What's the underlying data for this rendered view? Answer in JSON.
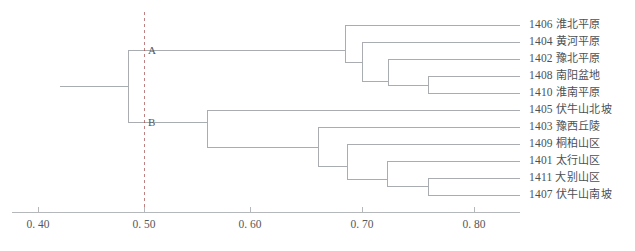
{
  "chart_data": {
    "type": "line",
    "title": "",
    "subtitle": "",
    "xlabel": "",
    "ylabel": "",
    "chart_kind": "dendrogram",
    "grid": false,
    "legend_position": "none",
    "axis": {
      "orientation": "horizontal",
      "ticks": [
        {
          "value": 0.4,
          "label": "0. 40",
          "x_px": 38
        },
        {
          "value": 0.5,
          "label": "0. 50",
          "x_px": 144
        },
        {
          "value": 0.6,
          "label": "0. 60",
          "x_px": 250
        },
        {
          "value": 0.7,
          "label": "0. 70",
          "x_px": 362
        },
        {
          "value": 0.8,
          "label": "0. 80",
          "x_px": 474
        }
      ],
      "xlim": [
        0.375,
        0.835
      ],
      "line_start_px": 12,
      "line_end_px": 520,
      "y_px": 212
    },
    "cut_line": {
      "value": 0.5,
      "x_px": 144,
      "style": "dashed",
      "label": ""
    },
    "cluster_tags": [
      {
        "label": "A",
        "x_px": 148,
        "y_px": 50
      },
      {
        "label": "B",
        "x_px": 148,
        "y_px": 122
      }
    ],
    "leaves": [
      {
        "code": "1406",
        "name": "淮北平原",
        "row": 1,
        "y_px": 25,
        "merge_x_px": 345
      },
      {
        "code": "1404",
        "name": "黄河平原",
        "row": 2,
        "y_px": 42,
        "merge_x_px": 362
      },
      {
        "code": "1402",
        "name": "豫北平原",
        "row": 3,
        "y_px": 59,
        "merge_x_px": 388
      },
      {
        "code": "1408",
        "name": "南阳盆地",
        "row": 4,
        "y_px": 76,
        "merge_x_px": 428
      },
      {
        "code": "1410",
        "name": "淮南平原",
        "row": 5,
        "y_px": 93,
        "merge_x_px": 428
      },
      {
        "code": "1405",
        "name": "伏牛山北坡",
        "row": 6,
        "y_px": 110,
        "merge_x_px": 207
      },
      {
        "code": "1403",
        "name": "豫西丘陵",
        "row": 7,
        "y_px": 127,
        "merge_x_px": 318
      },
      {
        "code": "1409",
        "name": "桐柏山区",
        "row": 8,
        "y_px": 144,
        "merge_x_px": 347
      },
      {
        "code": "1401",
        "name": "太行山区",
        "row": 9,
        "y_px": 161,
        "merge_x_px": 387
      },
      {
        "code": "1411",
        "name": "大别山区",
        "row": 10,
        "y_px": 178,
        "merge_x_px": 428
      },
      {
        "code": "1407",
        "name": "伏牛山南坡",
        "row": 11,
        "y_px": 195,
        "merge_x_px": 428
      }
    ],
    "nodes": [
      {
        "id": "root",
        "x_px": 128,
        "value": 0.485,
        "y_top_px": 50,
        "y_bot_px": 122,
        "stem_to_px": 60
      },
      {
        "id": "A1",
        "x_px": 345,
        "value": 0.689,
        "y_top_px": 25,
        "y_bot_px": 62
      },
      {
        "id": "A2",
        "x_px": 362,
        "value": 0.7,
        "y_top_px": 42,
        "y_bot_px": 81
      },
      {
        "id": "A3",
        "x_px": 388,
        "value": 0.723,
        "y_top_px": 59,
        "y_bot_px": 85
      },
      {
        "id": "A4",
        "x_px": 428,
        "value": 0.759,
        "y_top_px": 76,
        "y_bot_px": 93
      },
      {
        "id": "B1",
        "x_px": 207,
        "value": 0.555,
        "y_top_px": 110,
        "y_bot_px": 147
      },
      {
        "id": "B2",
        "x_px": 318,
        "value": 0.655,
        "y_top_px": 127,
        "y_bot_px": 166
      },
      {
        "id": "B3",
        "x_px": 347,
        "value": 0.681,
        "y_top_px": 144,
        "y_bot_px": 179
      },
      {
        "id": "B4",
        "x_px": 387,
        "value": 0.717,
        "y_top_px": 161,
        "y_bot_px": 186
      },
      {
        "id": "B5",
        "x_px": 428,
        "value": 0.759,
        "y_top_px": 178,
        "y_bot_px": 195
      }
    ],
    "leaf_line_end_px": 520,
    "colors": {
      "line": "#a9adb1",
      "axis": "#b4b8bb",
      "text": "#54585b",
      "cut_line": "#9b3f3f"
    }
  }
}
